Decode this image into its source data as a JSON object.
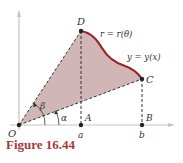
{
  "figure": {
    "caption": "Figure 16.44",
    "labels": {
      "origin": "O",
      "point_D": "D",
      "point_C": "C",
      "point_A": "A",
      "point_B": "B",
      "tick_a": "a",
      "tick_b": "b",
      "angle_alpha": "α",
      "angle_beta": "β",
      "polar_curve": "r = r(θ)",
      "cartesian_curve": "y = y(x)"
    },
    "colors": {
      "region_fill": "#c9a9aa",
      "curve": "#9b2226",
      "caption": "#a8383a",
      "axis": "#bfbfbf",
      "dashed": "#333333"
    }
  }
}
